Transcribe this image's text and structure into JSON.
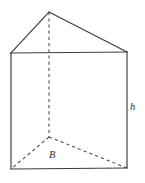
{
  "figure": {
    "kind": "triangular-prism",
    "background_color": "#ffffff",
    "solid_edge_color": "#3c3c3c",
    "hidden_edge_color": "#4a4a4a"
  },
  "labels": {
    "height": "h",
    "base": "B"
  },
  "geometry": {
    "apex_front": [
      49,
      12
    ],
    "front_top_left": [
      11,
      53
    ],
    "front_top_right": [
      127,
      52
    ],
    "front_bottom_left": [
      11,
      169
    ],
    "front_bottom_right": [
      127,
      168
    ],
    "back_bottom_center": [
      49,
      137
    ],
    "solid_edges": [
      "M 11 53 L 49 12",
      "M 49 12 L 127 52",
      "M 11 53 L 127 52",
      "M 11 53 L 11 169",
      "M 127 52 L 127 168",
      "M 11 169 L 127 168"
    ],
    "hidden_edges": [
      "M 49 12 L 49 137",
      "M 49 137 L 11 169",
      "M 49 137 L 127 168"
    ]
  }
}
